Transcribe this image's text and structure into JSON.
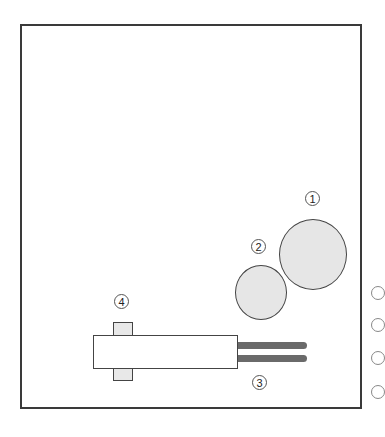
{
  "diagram": {
    "labels": [
      {
        "id": "label-1",
        "text": "1"
      },
      {
        "id": "label-2",
        "text": "2"
      },
      {
        "id": "label-3",
        "text": "3"
      },
      {
        "id": "label-4",
        "text": "4"
      }
    ],
    "components": {
      "large_circle": "circle-1",
      "small_circle": "circle-2",
      "rods": "rods-3",
      "clip": "clip-4"
    },
    "colors": {
      "frame": "#3a3a3a",
      "circle_fill": "#e6e6e6",
      "rod": "#6a6a6a"
    }
  }
}
